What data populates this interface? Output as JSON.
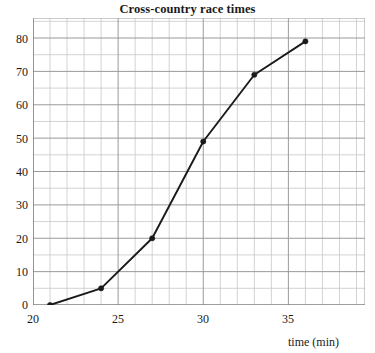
{
  "chart_data": {
    "type": "line",
    "title": "Cross-country race times",
    "xlabel": "time (min)",
    "ylabel": "",
    "xlim": [
      20,
      39.5
    ],
    "ylim": [
      0,
      86
    ],
    "xticks": [
      20,
      25,
      30,
      35
    ],
    "yticks": [
      0,
      10,
      20,
      30,
      40,
      50,
      60,
      70,
      80
    ],
    "x_minor_step": 1,
    "y_minor_step": 5,
    "grid": true,
    "legend": "none",
    "markers": "filled-circle",
    "series": [
      {
        "name": "race times",
        "color": "#1a1a1a",
        "points": [
          {
            "x": 21,
            "y": 0
          },
          {
            "x": 24,
            "y": 5
          },
          {
            "x": 27,
            "y": 20
          },
          {
            "x": 30,
            "y": 49
          },
          {
            "x": 33,
            "y": 69
          },
          {
            "x": 36,
            "y": 79
          }
        ]
      }
    ]
  },
  "axis": {
    "x_tick_labels": [
      "20",
      "25",
      "30",
      "35"
    ],
    "y_tick_labels": [
      "0",
      "10",
      "20",
      "30",
      "40",
      "50",
      "60",
      "70",
      "80"
    ],
    "x_label": "time (min)"
  },
  "colors": {
    "series": "#1a1a1a",
    "grid_minor": "#c8c8c8",
    "grid_major": "#9a9a9a",
    "axis": "#707070",
    "text": "#1a1a1a",
    "background": "#ffffff"
  }
}
